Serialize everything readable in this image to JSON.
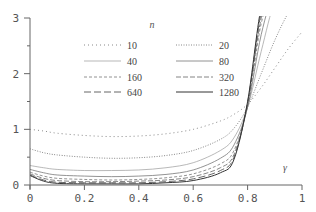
{
  "chart_data": {
    "type": "line",
    "title": "",
    "xlabel": "γ",
    "ylabel": "",
    "legend_title": "n",
    "xlim": [
      0,
      1
    ],
    "ylim": [
      0,
      3
    ],
    "grid": false,
    "legend_position": "upper-center",
    "x_ticks": [
      "0",
      "0.2",
      "0.4",
      "0.6",
      "0.8",
      "1"
    ],
    "y_ticks": [
      "0",
      "1",
      "2",
      "3"
    ],
    "x": [
      0,
      0.05,
      0.1,
      0.2,
      0.3,
      0.4,
      0.5,
      0.6,
      0.7,
      0.75,
      0.8,
      0.85,
      0.9,
      0.95,
      1.0
    ],
    "series": [
      {
        "name": "10",
        "style": "dotted-sparse",
        "values": [
          1.0,
          0.97,
          0.93,
          0.89,
          0.87,
          0.88,
          0.92,
          1.0,
          1.15,
          1.27,
          1.45,
          1.75,
          2.1,
          2.45,
          2.75
        ]
      },
      {
        "name": "20",
        "style": "dotted",
        "values": [
          0.65,
          0.58,
          0.54,
          0.5,
          0.48,
          0.49,
          0.53,
          0.62,
          0.82,
          1.02,
          1.4,
          2.0,
          2.6,
          3.1,
          3.5
        ]
      },
      {
        "name": "40",
        "style": "thin-solid",
        "values": [
          0.35,
          0.31,
          0.28,
          0.26,
          0.26,
          0.27,
          0.31,
          0.4,
          0.62,
          0.85,
          1.4,
          2.4,
          3.3,
          3.6,
          3.8
        ]
      },
      {
        "name": "80",
        "style": "thin-solid-2",
        "values": [
          0.28,
          0.22,
          0.18,
          0.16,
          0.15,
          0.16,
          0.19,
          0.27,
          0.48,
          0.72,
          1.4,
          2.7,
          3.5,
          3.7,
          3.9
        ]
      },
      {
        "name": "160",
        "style": "dashed-short",
        "values": [
          0.23,
          0.16,
          0.12,
          0.1,
          0.09,
          0.1,
          0.13,
          0.2,
          0.38,
          0.62,
          1.42,
          2.9,
          3.6,
          3.8,
          3.9
        ]
      },
      {
        "name": "320",
        "style": "dashed",
        "values": [
          0.2,
          0.12,
          0.08,
          0.06,
          0.06,
          0.07,
          0.09,
          0.15,
          0.31,
          0.55,
          1.45,
          3.0,
          3.7,
          3.9,
          4.0
        ]
      },
      {
        "name": "640",
        "style": "dashed-long",
        "values": [
          0.18,
          0.09,
          0.05,
          0.04,
          0.04,
          0.04,
          0.06,
          0.11,
          0.26,
          0.5,
          1.48,
          3.1,
          3.8,
          3.9,
          4.0
        ]
      },
      {
        "name": "1280",
        "style": "solid",
        "values": [
          0.17,
          0.07,
          0.03,
          0.02,
          0.02,
          0.02,
          0.04,
          0.08,
          0.22,
          0.46,
          1.5,
          3.2,
          3.9,
          4.0,
          4.0
        ]
      }
    ]
  }
}
